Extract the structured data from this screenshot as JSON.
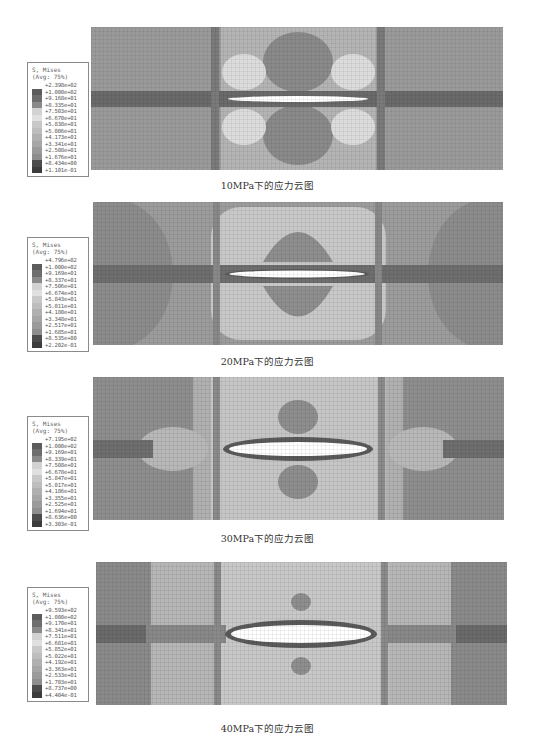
{
  "figures": [
    {
      "caption": "10MPa下的应力云图",
      "load": "10MPa",
      "legend": {
        "title": "S, Mises",
        "subtitle": "(Avg: 75%)",
        "values": [
          "+2.398e+02",
          "+1.000e+02",
          "+9.168e+01",
          "+8.335e+01",
          "+7.503e+01",
          "+6.670e+01",
          "+5.838e+01",
          "+5.006e+01",
          "+4.173e+01",
          "+3.341e+01",
          "+2.508e+01",
          "+1.676e+01",
          "+8.434e+00",
          "+1.101e-01"
        ]
      }
    },
    {
      "caption": "20MPa下的应力云图",
      "load": "20MPa",
      "legend": {
        "title": "S, Mises",
        "subtitle": "(Avg: 75%)",
        "values": [
          "+4.796e+02",
          "+1.000e+02",
          "+9.169e+01",
          "+8.337e+01",
          "+7.506e+01",
          "+6.674e+01",
          "+5.843e+01",
          "+5.011e+01",
          "+4.180e+01",
          "+3.348e+01",
          "+2.517e+01",
          "+1.685e+01",
          "+8.535e+00",
          "+2.202e-01"
        ]
      }
    },
    {
      "caption": "30MPa下的应力云图",
      "load": "30MPa",
      "legend": {
        "title": "S, Mises",
        "subtitle": "(Avg: 75%)",
        "values": [
          "+7.195e+02",
          "+1.000e+02",
          "+9.169e+01",
          "+8.339e+01",
          "+7.508e+01",
          "+6.678e+01",
          "+5.847e+01",
          "+5.017e+01",
          "+4.186e+01",
          "+3.355e+01",
          "+2.525e+01",
          "+1.694e+01",
          "+8.636e+00",
          "+3.303e-01"
        ]
      }
    },
    {
      "caption": "40MPa下的应力云图",
      "load": "40MPa",
      "legend": {
        "title": "S, Mises",
        "subtitle": "(Avg: 75%)",
        "values": [
          "+9.593e+02",
          "+1.000e+02",
          "+9.170e+01",
          "+8.341e+01",
          "+7.511e+01",
          "+6.681e+01",
          "+5.852e+01",
          "+5.022e+01",
          "+4.192e+01",
          "+3.363e+01",
          "+2.533e+01",
          "+1.703e+01",
          "+8.737e+00",
          "+4.404e-01"
        ]
      }
    }
  ],
  "legend_swatch_colors": [
    "#e6e6e6",
    "#5c5c5c",
    "#6e6e6e",
    "#8a8a8a",
    "#d2d2d2",
    "#e0e0e0",
    "#c8c8c8",
    "#bdbdbd",
    "#b0b0b0",
    "#a6a6a6",
    "#9a9a9a",
    "#8e8e8e",
    "#4c4c4c",
    "#3c3c3c"
  ]
}
